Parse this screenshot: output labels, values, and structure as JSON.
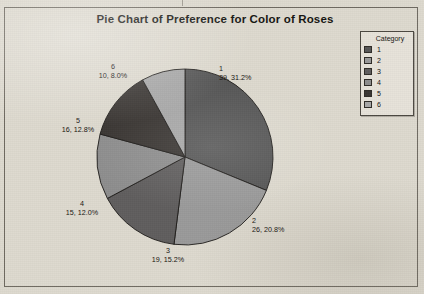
{
  "chart_frame": {
    "border_color": "#6f6a61"
  },
  "title": "Pie Chart of Preference for Color of Roses",
  "legend": {
    "title": "Category",
    "items": [
      {
        "label": "1",
        "color": "#575757"
      },
      {
        "label": "2",
        "color": "#9a9a9a"
      },
      {
        "label": "3",
        "color": "#605e5e"
      },
      {
        "label": "4",
        "color": "#8e8e8e"
      },
      {
        "label": "5",
        "color": "#3a3633"
      },
      {
        "label": "6",
        "color": "#a8a8a8"
      }
    ]
  },
  "labels": [
    {
      "cat": "1",
      "val": "39, 31.2%"
    },
    {
      "cat": "2",
      "val": "26, 20.8%"
    },
    {
      "cat": "3",
      "val": "19, 15.2%"
    },
    {
      "cat": "4",
      "val": "15, 12.0%"
    },
    {
      "cat": "5",
      "val": "16, 12.8%"
    },
    {
      "cat": "6",
      "val": "10, 8.0%"
    }
  ],
  "chart_data": {
    "type": "pie",
    "title": "Pie Chart of Preference for Color of Roses",
    "xlabel": "",
    "ylabel": "",
    "legend_title": "Category",
    "legend_position": "right",
    "grid": false,
    "total": 125,
    "start_angle_deg": 0,
    "direction": "clockwise",
    "categories": [
      "1",
      "2",
      "3",
      "4",
      "5",
      "6"
    ],
    "values": [
      39,
      26,
      19,
      15,
      16,
      10
    ],
    "percentages": [
      31.2,
      20.8,
      15.2,
      12.0,
      12.8,
      8.0
    ],
    "colors": [
      "#575757",
      "#9a9a9a",
      "#605e5e",
      "#8e8e8e",
      "#3a3633",
      "#a8a8a8"
    ],
    "slice_labels": [
      "39, 31.2%",
      "26, 20.8%",
      "19, 15.2%",
      "15, 12.0%",
      "16, 12.8%",
      "10, 8.0%"
    ],
    "geometry": {
      "center_x": 185,
      "center_y": 157,
      "radius": 88
    }
  }
}
